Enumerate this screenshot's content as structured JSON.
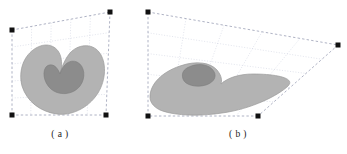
{
  "figure": {
    "title": "",
    "background": "#ffffff",
    "panels": [
      {
        "id": "a",
        "caption": "( a )",
        "cage": {
          "label": "control-lattice-a",
          "corners": [
            {
              "name": "top-left",
              "x": 12,
              "y": 30
            },
            {
              "name": "top-right",
              "x": 110,
              "y": 12
            },
            {
              "name": "bottom-right",
              "x": 106,
              "y": 115
            },
            {
              "name": "bottom-left",
              "x": 12,
              "y": 115
            }
          ],
          "rows": 5,
          "cols": 5,
          "line_style": "dashed",
          "line_color": "#9aa0b5",
          "grid_color": "#c8ccdd",
          "marker_color": "#111111",
          "marker_size": 5
        },
        "shape": {
          "name": "kidney-blob-undeformed",
          "outer_fill": "#b3b3b3",
          "outer_stroke": "#9a9a9a",
          "inner_fill": "#8c8c8c",
          "inner_stroke": "#7c7c7c",
          "outer_path": "M 22,86 C 18,70 24,55 36,48 C 48,41 59,47 61,58 C 63,68 60,74 60,74 C 60,74 63,61 70,53 C 78,44 92,43 99,52 C 107,62 106,80 98,93 C 88,109 70,116 57,114 C 41,112 27,102 22,86 Z",
          "inner_path": "M 47,66 C 52,63 57,66 60,74 C 63,64 70,59 77,62 C 85,66 86,78 80,86 C 73,95 59,96 51,89 C 43,82 42,70 47,66 Z"
        }
      },
      {
        "id": "b",
        "caption": "( b )",
        "cage": {
          "label": "control-lattice-b",
          "corners": [
            {
              "name": "top-left",
              "x": 148,
              "y": 12
            },
            {
              "name": "top-right",
              "x": 338,
              "y": 45
            },
            {
              "name": "bottom-right",
              "x": 258,
              "y": 116
            },
            {
              "name": "bottom-left",
              "x": 148,
              "y": 116
            }
          ],
          "rows": 5,
          "cols": 5,
          "line_style": "dashed",
          "line_color": "#9aa0b5",
          "grid_color": "#c8ccdd",
          "marker_color": "#111111",
          "marker_size": 5
        },
        "shape": {
          "name": "kidney-blob-deformed",
          "outer_fill": "#b3b3b3",
          "outer_stroke": "#9a9a9a",
          "inner_fill": "#8c8c8c",
          "inner_stroke": "#7c7c7c",
          "outer_path": "M 150,97 C 150,84 162,72 180,66 C 197,60 211,63 217,70 C 222,76 222,81 221,84 C 227,78 239,74 253,74 C 276,74 296,78 288,86 C 279,95 252,109 222,113 C 195,117 172,115 160,110 C 152,106 150,101 150,97 Z",
          "inner_path": "M 189,67 C 197,63 207,64 212,69 C 218,75 215,82 206,85 C 196,88 185,85 183,79 C 181,73 184,69 189,67 Z"
        }
      }
    ]
  }
}
